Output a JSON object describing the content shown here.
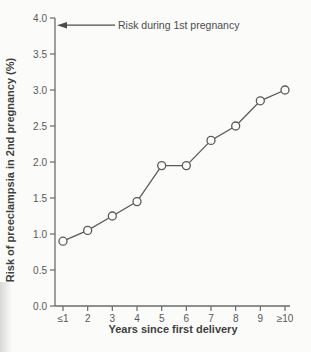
{
  "colors": {
    "background": "#fbfbf9",
    "ink": "#4c4c4c",
    "axis": "#6b6b6b",
    "line": "#5a5a5a",
    "marker_fill": "#fdfdfc"
  },
  "chart_data": {
    "type": "line",
    "title": "",
    "xlabel": "Years since first delivery",
    "ylabel": "Risk of preeclampsia in 2nd pregnancy (%)",
    "categories": [
      "≤1",
      "2",
      "3",
      "4",
      "5",
      "6",
      "7",
      "8",
      "9",
      "≥10"
    ],
    "values": [
      0.9,
      1.05,
      1.25,
      1.45,
      1.95,
      1.95,
      2.3,
      2.5,
      2.85,
      3.0
    ],
    "ylim": [
      0.0,
      4.0
    ],
    "ytick_step": 0.5,
    "ytick_labels": [
      "0.0",
      "0.5",
      "1.0",
      "1.5",
      "2.0",
      "2.5",
      "3.0",
      "3.5",
      "4.0"
    ],
    "grid": false,
    "legend": "none",
    "marker": "open-circle",
    "annotation": {
      "text": "Risk during 1st pregnancy",
      "y_value": 3.9,
      "arrow_direction": "left"
    }
  }
}
